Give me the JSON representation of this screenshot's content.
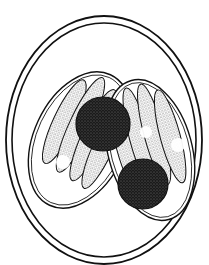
{
  "figure": {
    "style": "stippled-ink-line-drawing",
    "colors": {
      "background": "#ffffff",
      "ink": "#111111"
    },
    "parts": {
      "oocyst_wall": "double-walled ellipse",
      "sporocysts": 2,
      "residual_bodies": 2,
      "sporozoites_per_sporocyst": 4
    }
  }
}
